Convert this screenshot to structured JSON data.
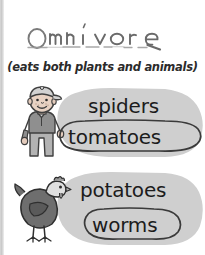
{
  "page": {
    "type": "handwriting-worksheet",
    "background_color": "#ffffff",
    "gutter_color": "#cfcfcf"
  },
  "title": {
    "word": "Omnivore",
    "style": "traced-handwriting",
    "ink_color": "#5b5b5b"
  },
  "subtitle": {
    "text": "(eats both plants and animals)",
    "color": "#2b2b2b"
  },
  "groups": [
    {
      "animal_icon": "boy-icon",
      "animal_label": "boy",
      "blob_color": "#cfcfcf",
      "items": [
        {
          "text": "spiders",
          "circled": false
        },
        {
          "text": "tomatoes",
          "circled": true
        }
      ]
    },
    {
      "animal_icon": "chicken-icon",
      "animal_label": "chicken",
      "blob_color": "#cfcfcf",
      "items": [
        {
          "text": "potatoes",
          "circled": false
        },
        {
          "text": "worms",
          "circled": true
        }
      ]
    }
  ],
  "colors": {
    "ink": "#1c1c1c",
    "blob": "#cfcfcf",
    "circle_outline": "#3a3a3a",
    "boy_skin": "#e8cfc0",
    "boy_shirt": "#8c8c8c",
    "boy_cap": "#d4d4d4",
    "hen_body": "#6e6e6e",
    "hen_head": "#e2e2e2"
  }
}
